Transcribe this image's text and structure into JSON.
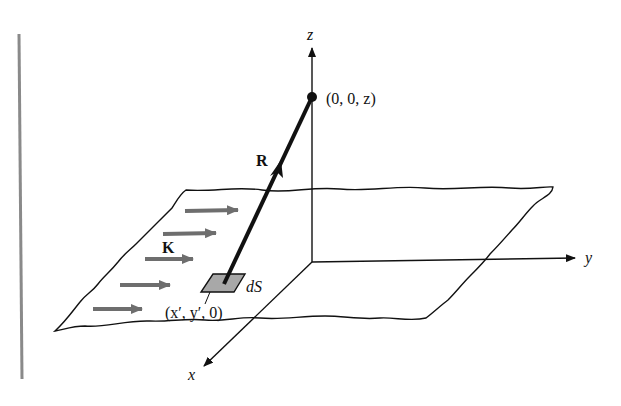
{
  "figure": {
    "type": "3d-coordinate-diagram",
    "labels": {
      "z_axis": "z",
      "y_axis": "y",
      "x_axis": "x",
      "field_point": "(0, 0, z)",
      "vector_R": "R",
      "surface_current": "K",
      "surface_element": "dS",
      "source_point": "(x′, y′, 0)"
    },
    "colors": {
      "ink": "#111111",
      "current_arrows": "#6e6e6e",
      "surface_element_fill": "#a8a8a8",
      "margin_bar": "#8a8a8a",
      "background": "#ffffff"
    },
    "current_arrow_count": 5
  }
}
